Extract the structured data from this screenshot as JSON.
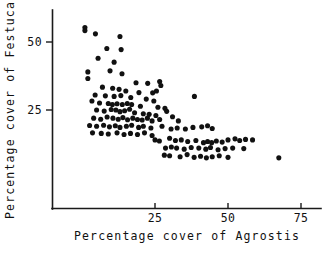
{
  "chart_data": {
    "type": "scatter",
    "title": "",
    "xlabel": "Percentage cover of Agrostis",
    "ylabel": "Percentage cover of Festuca",
    "xticks": [
      25,
      50,
      75
    ],
    "yticks": [
      25,
      50
    ],
    "xticklabels": [
      "25",
      "50",
      "75"
    ],
    "yticklabels": [
      "25",
      "50"
    ],
    "xlim": [
      -10.3,
      81.5
    ],
    "ylim": [
      -11.4,
      61.8
    ],
    "grid": false,
    "legend": null,
    "marker": "filled-circle",
    "marker_color": "#111111",
    "points": [
      [
        1.0,
        55.3
      ],
      [
        1.0,
        54.2
      ],
      [
        4.6,
        53.0
      ],
      [
        13.0,
        52.0
      ],
      [
        8.5,
        47.6
      ],
      [
        13.4,
        47.2
      ],
      [
        5.5,
        44.0
      ],
      [
        11.0,
        42.6
      ],
      [
        2.0,
        39.0
      ],
      [
        9.6,
        39.4
      ],
      [
        13.7,
        38.3
      ],
      [
        2.0,
        36.6
      ],
      [
        18.5,
        35.0
      ],
      [
        22.5,
        34.8
      ],
      [
        26.6,
        35.5
      ],
      [
        27.0,
        34.0
      ],
      [
        7.0,
        33.4
      ],
      [
        10.5,
        33.0
      ],
      [
        12.7,
        32.6
      ],
      [
        15.0,
        32.0
      ],
      [
        19.5,
        31.4
      ],
      [
        24.2,
        31.3
      ],
      [
        25.5,
        32.0
      ],
      [
        4.5,
        30.5
      ],
      [
        8.0,
        30.2
      ],
      [
        11.0,
        30.0
      ],
      [
        13.3,
        30.3
      ],
      [
        16.7,
        29.6
      ],
      [
        22.0,
        29.0
      ],
      [
        24.6,
        28.3
      ],
      [
        38.5,
        30.0
      ],
      [
        3.4,
        28.3
      ],
      [
        6.0,
        27.6
      ],
      [
        9.0,
        27.4
      ],
      [
        10.4,
        27.0
      ],
      [
        12.0,
        27.3
      ],
      [
        13.8,
        27.0
      ],
      [
        15.5,
        27.4
      ],
      [
        17.0,
        27.0
      ],
      [
        20.0,
        26.4
      ],
      [
        26.0,
        26.0
      ],
      [
        28.4,
        25.6
      ],
      [
        5.0,
        25.0
      ],
      [
        7.6,
        24.6
      ],
      [
        10.0,
        25.2
      ],
      [
        11.6,
        25.0
      ],
      [
        13.0,
        24.4
      ],
      [
        14.6,
        24.7
      ],
      [
        16.3,
        25.3
      ],
      [
        18.0,
        24.0
      ],
      [
        21.0,
        23.6
      ],
      [
        23.0,
        23.4
      ],
      [
        25.3,
        23.0
      ],
      [
        29.0,
        24.5
      ],
      [
        4.0,
        22.0
      ],
      [
        6.4,
        21.6
      ],
      [
        8.6,
        22.4
      ],
      [
        10.6,
        22.0
      ],
      [
        12.4,
        21.6
      ],
      [
        14.0,
        22.2
      ],
      [
        15.6,
        21.4
      ],
      [
        17.4,
        22.0
      ],
      [
        19.0,
        21.5
      ],
      [
        20.6,
        21.3
      ],
      [
        22.4,
        22.0
      ],
      [
        24.0,
        21.0
      ],
      [
        26.6,
        21.5
      ],
      [
        31.0,
        22.5
      ],
      [
        33.0,
        21.0
      ],
      [
        2.6,
        19.3
      ],
      [
        5.0,
        19.0
      ],
      [
        7.4,
        19.4
      ],
      [
        9.4,
        18.8
      ],
      [
        11.4,
        19.2
      ],
      [
        13.0,
        18.6
      ],
      [
        15.2,
        19.0
      ],
      [
        17.0,
        19.4
      ],
      [
        19.4,
        18.6
      ],
      [
        21.0,
        19.0
      ],
      [
        23.6,
        18.4
      ],
      [
        27.4,
        19.0
      ],
      [
        30.5,
        18.0
      ],
      [
        32.6,
        18.4
      ],
      [
        35.4,
        18.0
      ],
      [
        38.0,
        18.6
      ],
      [
        41.0,
        18.8
      ],
      [
        43.0,
        19.2
      ],
      [
        44.6,
        18.2
      ],
      [
        3.6,
        16.6
      ],
      [
        6.6,
        16.4
      ],
      [
        9.0,
        16.2
      ],
      [
        12.0,
        16.6
      ],
      [
        14.4,
        16.0
      ],
      [
        16.6,
        16.4
      ],
      [
        19.0,
        16.0
      ],
      [
        21.4,
        16.6
      ],
      [
        24.0,
        15.6
      ],
      [
        25.0,
        14.0
      ],
      [
        26.5,
        13.6
      ],
      [
        30.0,
        14.6
      ],
      [
        32.0,
        13.8
      ],
      [
        34.0,
        14.0
      ],
      [
        36.2,
        13.4
      ],
      [
        39.0,
        13.8
      ],
      [
        41.6,
        13.0
      ],
      [
        43.0,
        13.4
      ],
      [
        44.4,
        13.0
      ],
      [
        46.0,
        13.6
      ],
      [
        48.0,
        13.2
      ],
      [
        50.0,
        14.0
      ],
      [
        52.4,
        14.4
      ],
      [
        54.0,
        13.8
      ],
      [
        56.0,
        14.2
      ],
      [
        58.4,
        14.0
      ],
      [
        28.6,
        11.0
      ],
      [
        30.6,
        11.4
      ],
      [
        32.4,
        11.0
      ],
      [
        35.0,
        10.6
      ],
      [
        37.4,
        11.2
      ],
      [
        40.0,
        11.0
      ],
      [
        42.4,
        10.6
      ],
      [
        44.0,
        11.2
      ],
      [
        46.6,
        10.4
      ],
      [
        49.0,
        10.8
      ],
      [
        51.6,
        11.0
      ],
      [
        55.4,
        10.8
      ],
      [
        28.2,
        8.4
      ],
      [
        30.0,
        8.2
      ],
      [
        33.6,
        7.8
      ],
      [
        36.0,
        8.6
      ],
      [
        38.4,
        7.6
      ],
      [
        40.6,
        8.0
      ],
      [
        42.6,
        7.4
      ],
      [
        44.6,
        7.8
      ],
      [
        47.0,
        8.2
      ],
      [
        50.0,
        7.6
      ],
      [
        67.4,
        7.4
      ]
    ]
  }
}
